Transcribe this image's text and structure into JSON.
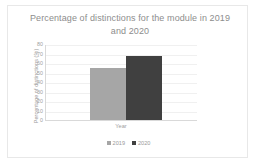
{
  "chart_data": {
    "type": "bar",
    "title": "Percentage of distinctions for the module in 2019 and 2020",
    "title_line1": "Percentage of distinctions for the module in 2019",
    "title_line2": "and 2020",
    "categories": [
      "Year"
    ],
    "xlabel": "Year",
    "ylabel": "Percentage of distinctions (%)",
    "ylim": [
      0,
      80
    ],
    "yticks": [
      80,
      70,
      60,
      50,
      40,
      30,
      20,
      10,
      0
    ],
    "ytick_labels": [
      "80",
      "70",
      "60",
      "50",
      "40",
      "30",
      "20",
      "10",
      "0"
    ],
    "grid": true,
    "grid_axis": "y",
    "legend_position": "bottom",
    "series": [
      {
        "name": "2019",
        "values": [
          55
        ],
        "color": "#a6a6a6"
      },
      {
        "name": "2020",
        "values": [
          67
        ],
        "color": "#404040"
      }
    ]
  },
  "legend": {
    "items": [
      {
        "label": "2019",
        "color": "#a6a6a6"
      },
      {
        "label": "2020",
        "color": "#404040"
      }
    ]
  }
}
